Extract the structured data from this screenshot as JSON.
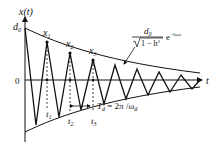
{
  "figure": {
    "type": "damped-oscillation-diagram",
    "y_axis_label": "x(t)",
    "x_axis_label": "t",
    "origin_label": "0",
    "initial_amplitude_label": "d",
    "initial_amplitude_sub": "0",
    "peaks": [
      {
        "label": "x",
        "sub": "1"
      },
      {
        "label": "x",
        "sub": "2"
      },
      {
        "label": "x",
        "sub": "3"
      }
    ],
    "times": [
      {
        "label": "t",
        "sub": "1"
      },
      {
        "label": "t",
        "sub": "2"
      },
      {
        "label": "t",
        "sub": "3"
      }
    ],
    "period_label": {
      "lhs": "T",
      "lhs_sub": "d",
      "eq": " = 2π /ω",
      "rhs_sub": "d"
    },
    "envelope": {
      "numerator": "d",
      "numerator_sub": "0",
      "denominator": "1 − h",
      "denominator_sup": "2",
      "exp_base": "e",
      "exp_power": "−hωt"
    }
  }
}
